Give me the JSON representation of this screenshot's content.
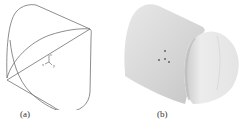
{
  "figure": {
    "panels": [
      {
        "id": "a",
        "caption": "(a)",
        "description": "wireframe outline",
        "axes": {
          "x": "x",
          "y": "y",
          "z": "z"
        }
      },
      {
        "id": "b",
        "caption": "(b)",
        "description": "shaded rendering"
      }
    ],
    "colors": {
      "line": "#6a6a6a",
      "shade_light": "#e6e6e6",
      "shade_mid": "#d2d2d2",
      "shade_dark": "#bdbdbd"
    }
  }
}
